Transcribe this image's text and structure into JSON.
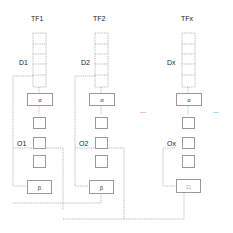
{
  "columns": [
    {
      "id": "tf1",
      "title": "TF1",
      "data_label": "D1",
      "output_label": "O1",
      "alpha": "α",
      "beta": "β",
      "cx": 39
    },
    {
      "id": "tf2",
      "title": "TF2",
      "data_label": "D2",
      "output_label": "O2",
      "alpha": "α",
      "beta": "β",
      "cx": 101
    },
    {
      "id": "tfx",
      "title": "TFx",
      "data_label": "Dx",
      "output_label": "Ox",
      "alpha": "α",
      "beta": "□",
      "cx": 188
    }
  ],
  "ellipsis": [
    "...",
    "..."
  ],
  "colors": {
    "line": "#9a9a9a",
    "text": "#222222"
  }
}
